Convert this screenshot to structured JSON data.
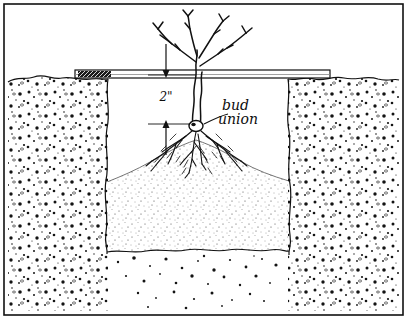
{
  "figure": {
    "background_color": "#ffffff",
    "ink_color": "#111111",
    "width": 407,
    "height": 319
  },
  "border": {
    "name": "frame",
    "color": "#111111"
  },
  "annotations": {
    "depth_dimension": {
      "value": "2\"",
      "description": "distance below board to bud union"
    },
    "bud_union": {
      "line1": "bud",
      "line2": "union",
      "description": "graft point on trunk"
    },
    "board_tag": {
      "value": "",
      "description": "dark hatched tag on left end of leveling board"
    }
  },
  "scene": {
    "board": {
      "name": "leveling-board",
      "left_x": 75,
      "right_x": 330,
      "top_y": 70,
      "bottom_y": 78
    },
    "grade_line": {
      "name": "ground-surface",
      "y": 78
    },
    "pit": {
      "name": "planting-hole",
      "left_wall_x": 108,
      "right_wall_x": 288,
      "bottom_y": 250
    },
    "backfill_mound": {
      "name": "soil-cone",
      "peak_x": 196,
      "peak_y": 140
    },
    "plant": {
      "name": "rose-bush",
      "cane_count": 3,
      "trunk_x": 196,
      "bud_union_y": 124
    }
  },
  "colors": {
    "ink": "#111111",
    "paper": "#ffffff",
    "soil_stipple": "#1a1a1a",
    "backfill_stipple": "#555555"
  }
}
